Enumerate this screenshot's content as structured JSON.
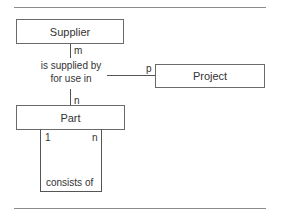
{
  "diagram": {
    "type": "entity-relationship",
    "entities": [
      {
        "id": "supplier",
        "label": "Supplier"
      },
      {
        "id": "project",
        "label": "Project"
      },
      {
        "id": "part",
        "label": "Part"
      }
    ],
    "relationships": [
      {
        "id": "supply",
        "label_line1": "is supplied by",
        "label_line2": "for use in",
        "cardinalities": {
          "supplier": "m",
          "project": "p",
          "part": "n"
        }
      },
      {
        "id": "composition",
        "label": "consists of",
        "cardinalities": {
          "left": "1",
          "right": "n"
        }
      }
    ],
    "colors": {
      "line": "#555555",
      "border": "#6a6a6a",
      "rule": "#8a8a8a",
      "text": "#333333"
    }
  }
}
